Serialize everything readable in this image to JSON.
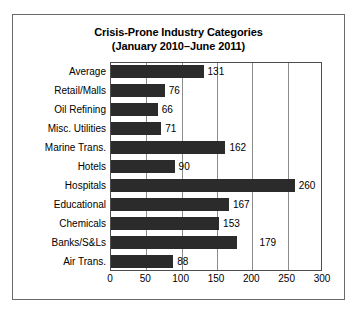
{
  "chart_data": {
    "type": "bar",
    "orientation": "horizontal",
    "title": "Crisis-Prone Industry Categories",
    "subtitle": "(January 2010–June 2011)",
    "xlabel": "",
    "ylabel": "",
    "xlim": [
      0,
      300
    ],
    "xticks": [
      0,
      50,
      100,
      150,
      200,
      250,
      300
    ],
    "grid": true,
    "legend": false,
    "bar_color": "#2b2b2b",
    "categories": [
      "Average",
      "Retail/Malls",
      "Oil Refining",
      "Misc. Utilities",
      "Marine Trans.",
      "Hotels",
      "Hospitals",
      "Educational",
      "Chemicals",
      "Banks/S&Ls",
      "Air Trans."
    ],
    "values": [
      131,
      76,
      66,
      71,
      162,
      90,
      260,
      167,
      153,
      179,
      88
    ],
    "value_labels": [
      "131",
      "76",
      "66",
      "71",
      "162",
      "90",
      "260",
      "167",
      "153",
      "179",
      "88"
    ],
    "label_offsets": [
      4,
      4,
      4,
      4,
      4,
      4,
      4,
      4,
      4,
      22,
      4
    ],
    "xtick_labels": [
      "0",
      "50",
      "100",
      "150",
      "200",
      "250",
      "300"
    ]
  }
}
